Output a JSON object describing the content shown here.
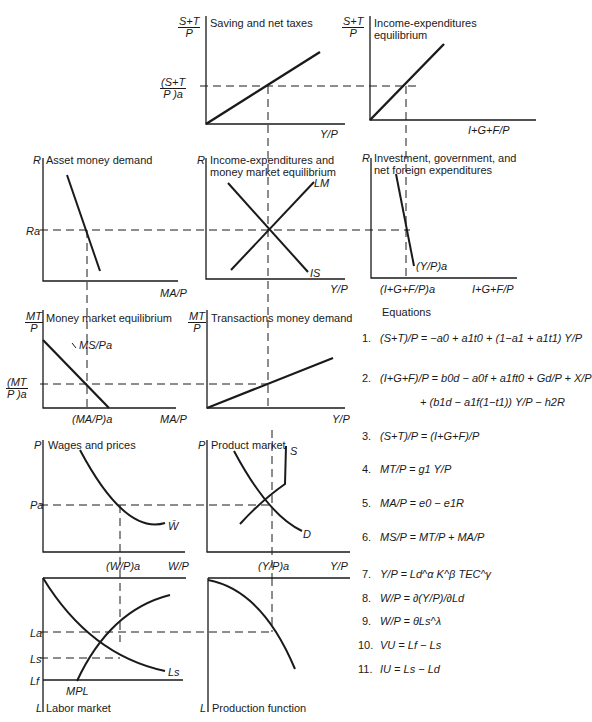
{
  "panels": {
    "saving_net_taxes": {
      "title": "Saving and net taxes",
      "y_axis": "S+T / P",
      "x_axis": "Y/P",
      "tick_y": "(S+T / P)a"
    },
    "income_expenditures_eq": {
      "title_line1": "Income-expenditures",
      "title_line2": "equilibrium",
      "y_axis": "S+T / P",
      "x_axis": "I+G+F/P"
    },
    "asset_money_demand": {
      "title": "Asset money demand",
      "y_axis": "R",
      "x_axis": "MA/P",
      "tick_y": "Ra"
    },
    "is_lm": {
      "title_line1": "Income-expenditures and",
      "title_line2": "money market equilibrium",
      "y_axis": "R",
      "x_axis": "Y/P",
      "curve_lm": "LM",
      "curve_is": "IS"
    },
    "investment_gov_foreign": {
      "title_line1": "Investment, government, and",
      "title_line2": "net foreign expenditures",
      "y_axis": "R",
      "x_axis": "I+G+F/P",
      "tick_x": "(I+G+F/P)a",
      "curve_label": "(Y/P)a"
    },
    "money_market_eq": {
      "title": "Money market equilibrium",
      "y_axis": "MT / P",
      "x_axis": "MA/P",
      "tick_y": "(MT / P)a",
      "tick_x": "(MA/P)a",
      "curve_label": "MS/Pa"
    },
    "transactions_money_demand": {
      "title": "Transactions money demand",
      "y_axis": "MT / P",
      "x_axis": "Y/P"
    },
    "wages_prices": {
      "title": "Wages and prices",
      "y_axis": "P",
      "x_axis": "W/P",
      "tick_y": "Pa",
      "tick_x": "(W/P)a",
      "curve_label": "W̄"
    },
    "product_market": {
      "title": "Product market",
      "y_axis": "P",
      "x_axis": "Y/P",
      "tick_x": "(Y/P)a",
      "curve_s": "S",
      "curve_d": "D"
    },
    "labor_market": {
      "title": "Labor market",
      "y_axis": "L",
      "tick_la": "La",
      "tick_ls": "Ls",
      "tick_lf": "Lf",
      "curve_ls": "Ls",
      "curve_mpl": "MPL"
    },
    "production_function": {
      "title": "Production function",
      "y_axis": "L"
    }
  },
  "equations": {
    "title": "Equations",
    "items": [
      {
        "n": "1.",
        "text": "(S+T)/P = −a0 + a1t0 + (1−a1 + a1t1) Y/P"
      },
      {
        "n": "2.",
        "text": "(I+G+F)/P = b0d − a0f + a1ft0 + Gd/P + X/P"
      },
      {
        "n": "",
        "text": "+ (b1d − a1f(1−t1)) Y/P − h2R"
      },
      {
        "n": "3.",
        "text": "(S+T)/P = (I+G+F)/P"
      },
      {
        "n": "4.",
        "text": "MT/P = g1 Y/P"
      },
      {
        "n": "5.",
        "text": "MA/P = e0 − e1R"
      },
      {
        "n": "6.",
        "text": "MS/P = MT/P + MA/P"
      },
      {
        "n": "7.",
        "text": "Y/P = Ld^α K^β TEC^γ"
      },
      {
        "n": "8.",
        "text": "W/P = ∂(Y/P)/∂Ld"
      },
      {
        "n": "9.",
        "text": "W/P = θLs^λ"
      },
      {
        "n": "10.",
        "text": "VU = Lf − Ls"
      },
      {
        "n": "11.",
        "text": "IU = Ls − Ld"
      }
    ]
  }
}
